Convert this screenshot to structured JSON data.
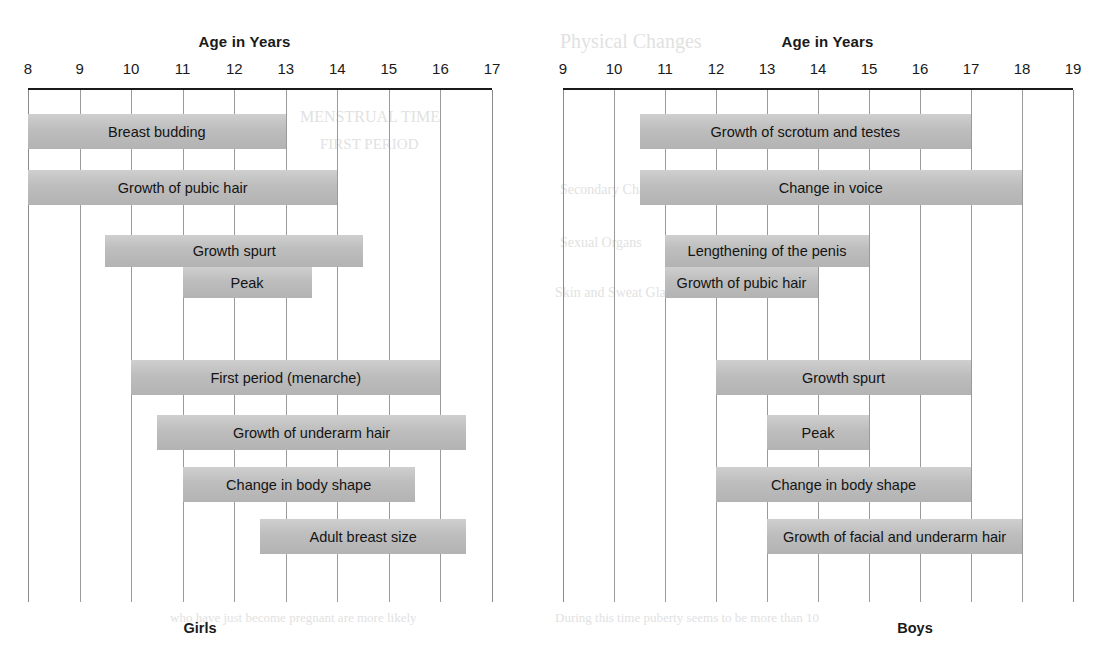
{
  "page": {
    "background": "#ffffff",
    "bar_color": "#bdbdbd",
    "grid_color": "#9a9a9a",
    "axis_color": "#1a1a1a"
  },
  "ghost_text": [
    {
      "text": "Physical Changes",
      "x": 560,
      "y": 30,
      "size": 20
    },
    {
      "text": "MENSTRUAL TIME",
      "x": 300,
      "y": 108,
      "size": 16
    },
    {
      "text": "FIRST PERIOD",
      "x": 320,
      "y": 136,
      "size": 15
    },
    {
      "text": "Secondary Characteristics",
      "x": 560,
      "y": 182,
      "size": 14
    },
    {
      "text": "Sexual Organs",
      "x": 560,
      "y": 235,
      "size": 14
    },
    {
      "text": "Skin and Sweat Glands",
      "x": 555,
      "y": 285,
      "size": 14
    },
    {
      "text": "who have just become pregnant are more likely",
      "x": 170,
      "y": 610,
      "size": 13
    },
    {
      "text": "During this time puberty seems to be more than 10",
      "x": 555,
      "y": 610,
      "size": 13
    }
  ],
  "chart_data": [
    {
      "id": "girls",
      "type": "bar",
      "orientation": "horizontal-range",
      "title": "Age in Years",
      "footer": "Girls",
      "xlabel": "Age in Years",
      "ylabel": "",
      "xlim": [
        8,
        17
      ],
      "ticks": [
        8,
        9,
        10,
        11,
        12,
        13,
        14,
        15,
        16,
        17
      ],
      "grid": true,
      "legend": "none",
      "bars": [
        {
          "label": "Breast budding",
          "start": 8.0,
          "end": 13.0,
          "row": 0
        },
        {
          "label": "Growth of pubic hair",
          "start": 8.0,
          "end": 14.0,
          "row": 1
        },
        {
          "label": "Growth spurt",
          "start": 9.5,
          "end": 14.5,
          "row": 2
        },
        {
          "label": "Peak",
          "start": 11.0,
          "end": 13.5,
          "row": 3
        },
        {
          "label": "First period (menarche)",
          "start": 10.0,
          "end": 16.0,
          "row": 4
        },
        {
          "label": "Growth of underarm hair",
          "start": 10.5,
          "end": 16.5,
          "row": 5
        },
        {
          "label": "Change in body shape",
          "start": 11.0,
          "end": 15.5,
          "row": 6
        },
        {
          "label": "Adult breast size",
          "start": 12.5,
          "end": 16.5,
          "row": 7
        }
      ]
    },
    {
      "id": "boys",
      "type": "bar",
      "orientation": "horizontal-range",
      "title": "Age in Years",
      "footer": "Boys",
      "xlabel": "Age in Years",
      "ylabel": "",
      "xlim": [
        9,
        19
      ],
      "ticks": [
        9,
        10,
        11,
        12,
        13,
        14,
        15,
        16,
        17,
        18,
        19
      ],
      "grid": true,
      "legend": "none",
      "bars": [
        {
          "label": "Growth of scrotum and testes",
          "start": 10.5,
          "end": 17.0,
          "row": 0
        },
        {
          "label": "Change in voice",
          "start": 10.5,
          "end": 18.0,
          "row": 1
        },
        {
          "label": "Lengthening of the penis",
          "start": 11.0,
          "end": 15.0,
          "row": 2
        },
        {
          "label": "Growth of pubic hair",
          "start": 11.0,
          "end": 14.0,
          "row": 3
        },
        {
          "label": "Growth spurt",
          "start": 12.0,
          "end": 17.0,
          "row": 4
        },
        {
          "label": "Peak",
          "start": 13.0,
          "end": 15.0,
          "row": 5
        },
        {
          "label": "Change in body shape",
          "start": 12.0,
          "end": 17.0,
          "row": 6
        },
        {
          "label": "Growth of facial and underarm hair",
          "start": 13.0,
          "end": 18.0,
          "row": 7
        }
      ]
    }
  ]
}
